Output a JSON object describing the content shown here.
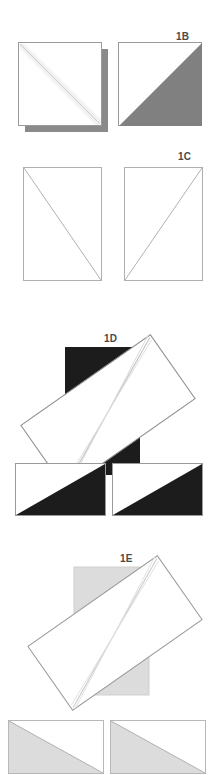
{
  "document": {
    "type": "paper-folding-sequence-diagram",
    "background": "#ffffff",
    "width": 214,
    "height": 775
  },
  "palette": {
    "paper_white": "#ffffff",
    "outline": "#8c8c8c",
    "outline_light": "#b4b4b4",
    "fold_line": "#c8c8c8",
    "medium_gray": "#808080",
    "light_gray": "#dcdcdc",
    "light_gray_edge": "#c0c0c0",
    "black": "#1c1c1c",
    "label_color": "#4a4a4a",
    "shadow_gray": "#8a8a8a"
  },
  "panels": [
    {
      "id": "panel-1b",
      "label": "1B",
      "label_x": 176,
      "label_y": 31,
      "figures": [
        {
          "name": "folded-square-with-shadow",
          "kind": "square",
          "fill": "#ffffff",
          "fold": "diagonal-tl-br",
          "shadow": true
        },
        {
          "name": "square-half-gray",
          "kind": "square",
          "fill": "#ffffff",
          "triangle_fill": "#808080",
          "triangle_corner": "lower-right"
        }
      ]
    },
    {
      "id": "panel-1c",
      "label": "1C",
      "label_x": 178,
      "label_y": 151,
      "figures": [
        {
          "name": "tall-rect-diagonal-tl-br",
          "kind": "rect-portrait",
          "fill": "#ffffff",
          "diagonal": "tl-br"
        },
        {
          "name": "tall-rect-diagonal-bl-tr",
          "kind": "rect-portrait",
          "fill": "#ffffff",
          "diagonal": "bl-tr"
        }
      ]
    },
    {
      "id": "panel-1d",
      "label": "1D",
      "label_x": 104,
      "label_y": 333,
      "figures": [
        {
          "name": "rotated-paper-over-black-square",
          "kind": "composite-rotated",
          "base_fill": "#1c1c1c",
          "paper_fill": "#ffffff",
          "rotation_deg": -35
        },
        {
          "name": "wide-rect-black-triangle-left",
          "kind": "rect-landscape",
          "fill": "#ffffff",
          "triangle_fill": "#1c1c1c",
          "triangle_corner": "lower-right"
        },
        {
          "name": "wide-rect-black-triangle-right",
          "kind": "rect-landscape",
          "fill": "#ffffff",
          "triangle_fill": "#1c1c1c",
          "triangle_corner": "lower-right"
        }
      ]
    },
    {
      "id": "panel-1e",
      "label": "1E",
      "label_x": 120,
      "label_y": 553,
      "figures": [
        {
          "name": "rotated-paper-over-gray-square",
          "kind": "composite-rotated",
          "base_fill": "#dcdcdc",
          "paper_fill": "#ffffff",
          "rotation_deg": -35
        },
        {
          "name": "wide-rect-gray-triangle-left",
          "kind": "rect-landscape",
          "fill": "#ffffff",
          "triangle_fill": "#dcdcdc",
          "triangle_corner": "lower-left"
        },
        {
          "name": "wide-rect-gray-triangle-right",
          "kind": "rect-landscape",
          "fill": "#ffffff",
          "triangle_fill": "#dcdcdc",
          "triangle_corner": "lower-left"
        }
      ]
    }
  ]
}
